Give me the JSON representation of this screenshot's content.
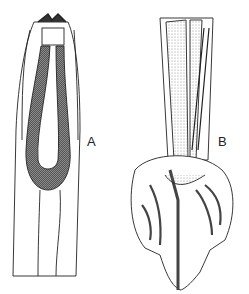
{
  "figure": {
    "panels": [
      {
        "label": "A",
        "description": "anterior end with buccal capsule and elongated pharynx"
      },
      {
        "label": "B",
        "description": "posterior end with copulatory bursa and rays"
      }
    ],
    "colors": {
      "ink": "#222222",
      "background": "#ffffff",
      "stipple": "#777777"
    }
  }
}
